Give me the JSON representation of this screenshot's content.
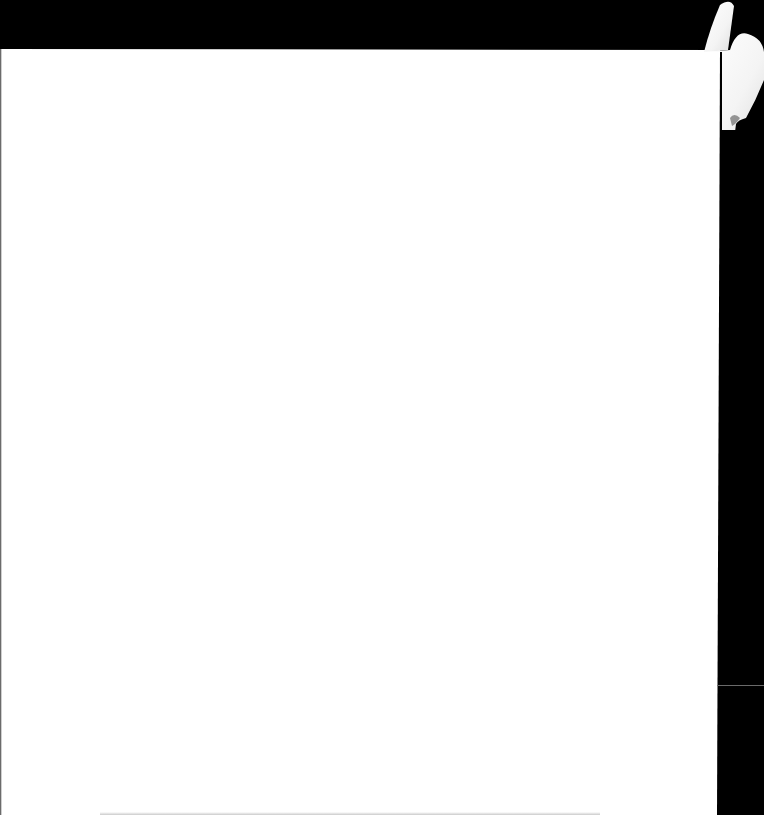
{
  "scene": {
    "description": "Blank white sheet of paper on a black background",
    "background_color": "#000000",
    "paper_color": "#ffffff",
    "objects": [
      {
        "name": "blank-paper-sheet",
        "text": ""
      },
      {
        "name": "hand",
        "location": "top-right corner"
      }
    ]
  }
}
